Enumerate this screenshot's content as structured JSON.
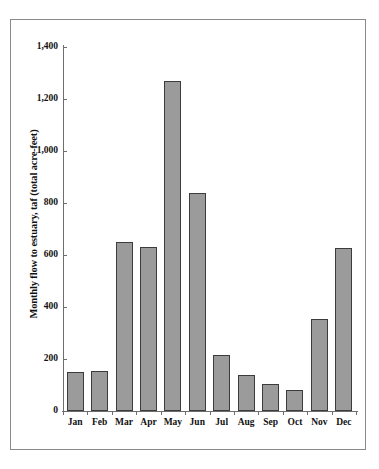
{
  "chart_data": {
    "type": "bar",
    "title": "",
    "xlabel": "",
    "ylabel": "Monthly flow to estuary, taf (total acre-feet)",
    "categories": [
      "Jan",
      "Feb",
      "Mar",
      "Apr",
      "May",
      "Jun",
      "Jul",
      "Aug",
      "Sep",
      "Oct",
      "Nov",
      "Dec"
    ],
    "values": [
      150,
      155,
      650,
      630,
      1270,
      840,
      215,
      140,
      105,
      80,
      355,
      628
    ],
    "ylim": [
      0,
      1400
    ],
    "ytick_values": [
      0,
      200,
      400,
      600,
      800,
      1000,
      1200,
      1400
    ],
    "ytick_labels": [
      "0",
      "200",
      "400",
      "600",
      "800",
      "1,000",
      "1,200",
      "1,400"
    ],
    "grid": false,
    "legend": null,
    "bar_fill_color": "#9b9b9b",
    "bar_edge_color": "#3c3c3c",
    "axis_color": "#6e6e6e",
    "background_color": "#ffffff"
  }
}
